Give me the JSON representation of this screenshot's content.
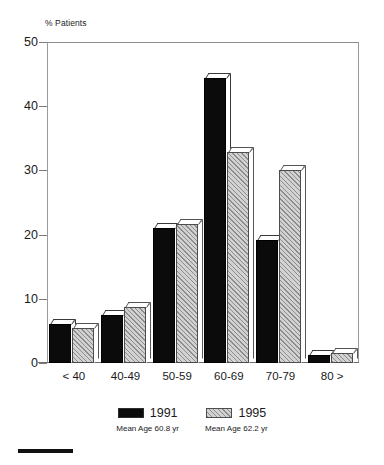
{
  "chart_data": {
    "type": "bar",
    "title": "",
    "subtitle": "",
    "xlabel": "",
    "ylabel": "% Patients",
    "ylim": [
      0,
      50
    ],
    "yticks": [
      0,
      10,
      20,
      30,
      40,
      50
    ],
    "grid": false,
    "legend_position": "bottom",
    "categories": [
      "< 40",
      "40-49",
      "50-59",
      "60-69",
      "70-79",
      "80 >"
    ],
    "series": [
      {
        "name": "1991",
        "color": "#0b0b0b",
        "note": "Mean Age 60.8 yr",
        "values": [
          6.1,
          7.5,
          21.0,
          44.4,
          19.2,
          1.3
        ]
      },
      {
        "name": "1995",
        "color": "#d2d2d2",
        "note": "Mean Age 62.2 yr",
        "values": [
          5.5,
          8.7,
          21.6,
          32.9,
          30.0,
          1.6
        ]
      }
    ]
  },
  "axis": {
    "y_title": "% Patients",
    "y_tick_labels": [
      "50",
      "40",
      "30",
      "20",
      "10",
      "0"
    ],
    "x_tick_labels": [
      "< 40",
      "40-49",
      "50-59",
      "60-69",
      "70-79",
      "80 >"
    ]
  },
  "legend": {
    "entries": [
      {
        "label": "1991",
        "sub": "Mean Age 60.8 yr"
      },
      {
        "label": "1995",
        "sub": "Mean Age 62.2 yr"
      }
    ]
  }
}
